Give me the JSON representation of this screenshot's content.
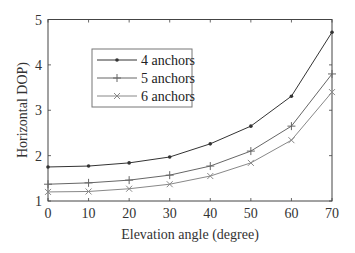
{
  "chart_data": {
    "type": "line",
    "title": "",
    "xlabel": "Elevation angle (degree)",
    "ylabel": "Horizontal DOP)",
    "x": [
      0,
      10,
      20,
      30,
      40,
      50,
      60,
      70
    ],
    "xlim": [
      0,
      70
    ],
    "ylim": [
      1,
      5
    ],
    "xticks": [
      0,
      10,
      20,
      30,
      40,
      50,
      60,
      70
    ],
    "yticks": [
      1,
      2,
      3,
      4,
      5
    ],
    "grid": false,
    "legend_position": "upper left (inset)",
    "series": [
      {
        "name": "4 anchors",
        "marker": "dot",
        "color": "#333333",
        "values": [
          1.75,
          1.77,
          1.84,
          1.97,
          2.26,
          2.65,
          3.31,
          4.72
        ]
      },
      {
        "name": "5 anchors",
        "marker": "plus",
        "color": "#666666",
        "values": [
          1.37,
          1.4,
          1.46,
          1.57,
          1.77,
          2.1,
          2.65,
          3.8
        ]
      },
      {
        "name": "6 anchors",
        "marker": "x",
        "color": "#888888",
        "values": [
          1.2,
          1.21,
          1.27,
          1.37,
          1.55,
          1.84,
          2.34,
          3.4
        ]
      }
    ]
  }
}
